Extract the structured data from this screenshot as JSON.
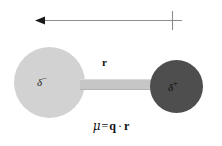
{
  "figure": {
    "background_color": "#ffffff"
  },
  "dipole_arrow": {
    "name": "dipole-moment-vector",
    "direction": "right-to-left",
    "head_side": "left",
    "cross_tick_side": "right",
    "line_color": "#8c8c8c",
    "head_color": "#1a1a1a",
    "x_start": 182,
    "x_end": 35,
    "y": 20
  },
  "atoms": [
    {
      "name": "atom-partial-negative",
      "charge_symbol": "δ",
      "charge_sign": "−",
      "color": "#d2d2d2",
      "cx": 49,
      "cy": 82,
      "r": 35
    },
    {
      "name": "atom-partial-positive",
      "charge_symbol": "δ",
      "charge_sign": "+",
      "color": "#4e4e4e",
      "cx": 176,
      "cy": 86,
      "r": 26
    }
  ],
  "bond": {
    "name": "bond-bar",
    "label": "r",
    "color": "#c6c6c6"
  },
  "equation": {
    "mu": "μ",
    "equals": "=",
    "charge": "q",
    "operator": "·",
    "distance": "r",
    "full_text": "μ = q · r"
  }
}
